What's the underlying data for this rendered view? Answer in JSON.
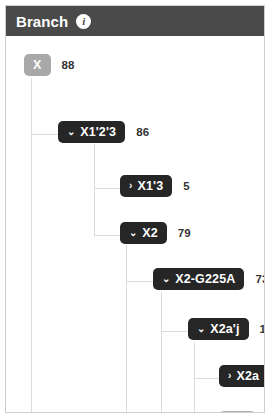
{
  "header": {
    "title": "Branch",
    "info_icon": "info-icon",
    "info_glyph": "i",
    "background_color": "#4a4a4a"
  },
  "colors": {
    "header_bg": "#4a4a4a",
    "node_dark": "#262626",
    "node_grey": "#a8a8a8",
    "node_leaf_grey": "#b0b0b0",
    "tree_line": "#dcdcdc",
    "panel_border": "#cfcfcf",
    "panel_bg": "#ffffff",
    "count_text": "#333333"
  },
  "tree": {
    "nodes": [
      {
        "id": "x",
        "label": "X",
        "count": "88",
        "style": "grey",
        "toggle": "none",
        "toggle_glyph": "",
        "depth": 0
      },
      {
        "id": "x123",
        "label": "X1'2'3",
        "count": "86",
        "style": "dark",
        "toggle": "expanded",
        "toggle_glyph": "⌄",
        "depth": 1
      },
      {
        "id": "x13",
        "label": "X1'3",
        "count": "5",
        "style": "dark",
        "toggle": "collapsed",
        "toggle_glyph": "›",
        "depth": 2
      },
      {
        "id": "x2",
        "label": "X2",
        "count": "79",
        "style": "dark",
        "toggle": "expanded",
        "toggle_glyph": "⌄",
        "depth": 2
      },
      {
        "id": "x2g225a",
        "label": "X2-G225A",
        "count": "73",
        "style": "dark",
        "toggle": "expanded",
        "toggle_glyph": "⌄",
        "depth": 3
      },
      {
        "id": "x2aj",
        "label": "X2a'j",
        "count": "10",
        "style": "dark",
        "toggle": "expanded",
        "toggle_glyph": "⌄",
        "depth": 4
      },
      {
        "id": "x2a",
        "label": "X2a",
        "count": "8",
        "style": "dark",
        "toggle": "collapsed",
        "toggle_glyph": "›",
        "depth": 5
      },
      {
        "id": "x2j",
        "label": "X2j",
        "count": "",
        "style": "grey-leaf",
        "toggle": "none",
        "toggle_glyph": "",
        "depth": 5
      }
    ]
  }
}
